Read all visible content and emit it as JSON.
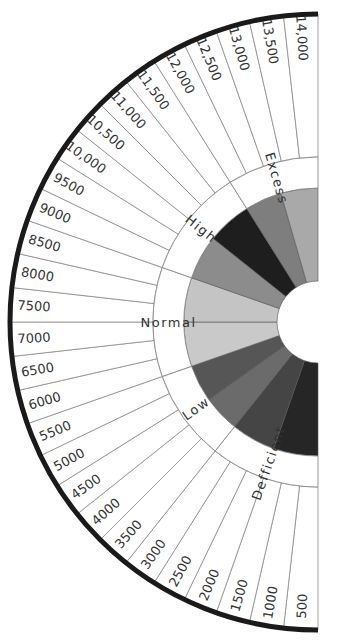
{
  "chart_data": {
    "type": "pie",
    "subtype": "semicircular-dial",
    "title": "",
    "center": [
      318,
      322
    ],
    "radii": {
      "outer": 308,
      "category_outer": 165,
      "category_inner": 134,
      "hole": 41
    },
    "tick_labels": [
      "500",
      "1000",
      "1500",
      "2000",
      "2500",
      "3000",
      "3500",
      "4000",
      "4500",
      "5000",
      "5500",
      "6000",
      "6500",
      "7000",
      "7500",
      "8000",
      "8500",
      "9000",
      "9500",
      "10,000",
      "10,500",
      "11,000",
      "11,500",
      "12,000",
      "12,500",
      "13,000",
      "13,500",
      "14,000"
    ],
    "categories": [
      {
        "name": "Defficient",
        "from": "500",
        "to": "3000",
        "segments": 6,
        "wedge_colors": [
          "#262626",
          "#454545"
        ]
      },
      {
        "name": "Low",
        "from": "3500",
        "to": "5500",
        "segments": 5,
        "wedge_colors": [
          "#6b6b6b",
          "#565656"
        ]
      },
      {
        "name": "Normal",
        "from": "6000",
        "to": "8500",
        "segments": 6,
        "wedge_colors": [
          "#c9c9c9",
          "#c4c4c4"
        ]
      },
      {
        "name": "High",
        "from": "9000",
        "to": "11,500",
        "segments": 6,
        "wedge_colors": [
          "#8c8c8c",
          "#1e1e1e"
        ]
      },
      {
        "name": "Excess",
        "from": "12,000",
        "to": "14,000",
        "segments": 5,
        "wedge_colors": [
          "#7e7e7e",
          "#a9a9a9"
        ]
      }
    ],
    "colors": {
      "outer_rim": "#1a1a1a",
      "lines": "#8a8a8a",
      "text": "#333333",
      "background": "#ffffff"
    }
  }
}
